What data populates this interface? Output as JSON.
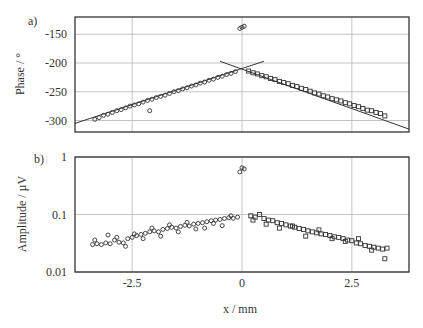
{
  "chart_data": [
    {
      "type": "scatter",
      "panel_label": "a)",
      "title": "",
      "xlabel": "x / mm",
      "ylabel": "Phase / °",
      "xlim": [
        -3.8,
        3.8
      ],
      "ylim": [
        -320,
        -120
      ],
      "yticks": [
        -150,
        -200,
        -250,
        -300
      ],
      "ytick_labels": [
        "-150",
        "-200",
        "-250",
        "-300"
      ],
      "xticks": [
        -2.5,
        0,
        2.5
      ],
      "grid": true,
      "fit_lines": [
        {
          "name": "left linear fit",
          "x": [
            -3.8,
            0.5
          ],
          "y": [
            -305,
            -197
          ]
        },
        {
          "name": "right linear fit",
          "x": [
            -0.5,
            3.8
          ],
          "y": [
            -197,
            -315
          ]
        }
      ],
      "series": [
        {
          "name": "left data (circles)",
          "marker": "circle",
          "x": [
            -3.35,
            -3.25,
            -3.15,
            -3.05,
            -2.95,
            -2.85,
            -2.75,
            -2.65,
            -2.55,
            -2.45,
            -2.35,
            -2.25,
            -2.15,
            -2.05,
            -1.95,
            -1.85,
            -1.75,
            -1.65,
            -1.55,
            -1.45,
            -1.35,
            -1.25,
            -1.15,
            -1.05,
            -0.95,
            -0.85,
            -0.75,
            -0.65,
            -0.55,
            -0.45,
            -0.35,
            -0.25,
            -0.15,
            -2.1
          ],
          "y": [
            -298,
            -295,
            -291,
            -289,
            -286,
            -283,
            -281,
            -278,
            -275,
            -273,
            -271,
            -268,
            -265,
            -263,
            -260,
            -258,
            -256,
            -253,
            -250,
            -248,
            -245,
            -243,
            -240,
            -238,
            -235,
            -233,
            -230,
            -228,
            -225,
            -223,
            -220,
            -218,
            -215,
            -283
          ]
        },
        {
          "name": "right data (squares)",
          "marker": "square",
          "x": [
            0.15,
            0.25,
            0.35,
            0.45,
            0.55,
            0.65,
            0.75,
            0.85,
            0.95,
            1.05,
            1.15,
            1.25,
            1.35,
            1.45,
            1.55,
            1.65,
            1.75,
            1.85,
            1.95,
            2.05,
            2.15,
            2.25,
            2.35,
            2.45,
            2.55,
            2.65,
            2.75,
            2.85,
            2.95,
            3.05,
            3.15,
            3.25
          ],
          "y": [
            -214,
            -217,
            -219,
            -222,
            -224,
            -227,
            -229,
            -232,
            -234,
            -236,
            -239,
            -241,
            -244,
            -246,
            -249,
            -252,
            -254,
            -257,
            -259,
            -262,
            -264,
            -266,
            -269,
            -271,
            -274,
            -276,
            -279,
            -282,
            -283,
            -286,
            -288,
            -292
          ]
        },
        {
          "name": "center spike",
          "marker": "circle",
          "x": [
            -0.05,
            0.0,
            0.05
          ],
          "y": [
            -140,
            -138,
            -136
          ]
        }
      ]
    },
    {
      "type": "scatter",
      "panel_label": "b)",
      "title": "",
      "xlabel": "x / mm",
      "ylabel": "Amplitude / µV",
      "yscale": "log",
      "xlim": [
        -3.8,
        3.8
      ],
      "ylim": [
        0.01,
        1
      ],
      "yticks": [
        1,
        0.1,
        0.01
      ],
      "ytick_labels": [
        "1",
        "0.1",
        "0.01"
      ],
      "xticks": [
        -2.5,
        0,
        2.5
      ],
      "xtick_labels": [
        "-2.5",
        "0",
        "2.5"
      ],
      "grid": true,
      "series": [
        {
          "name": "left data (circles)",
          "marker": "circle",
          "x": [
            -3.4,
            -3.3,
            -3.2,
            -3.1,
            -3.0,
            -2.9,
            -2.8,
            -2.7,
            -2.6,
            -2.5,
            -2.4,
            -2.3,
            -2.2,
            -2.1,
            -2.0,
            -1.9,
            -1.8,
            -1.7,
            -1.6,
            -1.5,
            -1.4,
            -1.3,
            -1.2,
            -1.1,
            -1.0,
            -0.9,
            -0.8,
            -0.7,
            -0.6,
            -0.5,
            -0.4,
            -0.3,
            -0.2,
            -0.1,
            -3.35,
            -3.05,
            -2.85,
            -2.65,
            -2.45,
            -2.25,
            -2.05,
            -1.85,
            -1.65,
            -1.45,
            -1.25,
            -1.05,
            -0.85,
            -0.65,
            -0.45,
            -0.25
          ],
          "y": [
            0.03,
            0.031,
            0.03,
            0.032,
            0.031,
            0.036,
            0.033,
            0.032,
            0.038,
            0.04,
            0.043,
            0.045,
            0.047,
            0.05,
            0.052,
            0.05,
            0.055,
            0.057,
            0.06,
            0.058,
            0.062,
            0.065,
            0.063,
            0.068,
            0.07,
            0.072,
            0.075,
            0.078,
            0.08,
            0.082,
            0.085,
            0.088,
            0.086,
            0.09,
            0.036,
            0.044,
            0.04,
            0.028,
            0.046,
            0.038,
            0.058,
            0.042,
            0.066,
            0.05,
            0.073,
            0.056,
            0.058,
            0.07,
            0.064,
            0.095
          ]
        },
        {
          "name": "right data (squares)",
          "marker": "square",
          "x": [
            0.2,
            0.3,
            0.4,
            0.5,
            0.6,
            0.7,
            0.8,
            0.9,
            1.0,
            1.1,
            1.2,
            1.3,
            1.4,
            1.5,
            1.6,
            1.7,
            1.8,
            1.9,
            2.0,
            2.1,
            2.2,
            2.3,
            2.4,
            2.5,
            2.6,
            2.7,
            2.8,
            2.9,
            3.0,
            3.1,
            3.2,
            3.3,
            0.25,
            0.55,
            0.85,
            1.15,
            1.45,
            1.75,
            2.05,
            2.35,
            2.65,
            2.95,
            3.25
          ],
          "y": [
            0.095,
            0.09,
            0.1,
            0.085,
            0.08,
            0.078,
            0.072,
            0.07,
            0.066,
            0.063,
            0.06,
            0.057,
            0.055,
            0.052,
            0.05,
            0.048,
            0.046,
            0.045,
            0.043,
            0.041,
            0.04,
            0.038,
            0.036,
            0.035,
            0.032,
            0.031,
            0.029,
            0.028,
            0.027,
            0.026,
            0.025,
            0.026,
            0.08,
            0.068,
            0.058,
            0.063,
            0.042,
            0.054,
            0.038,
            0.034,
            0.038,
            0.024,
            0.017
          ]
        },
        {
          "name": "center spike",
          "marker": "circle",
          "x": [
            -0.05,
            0.0,
            0.05
          ],
          "y": [
            0.55,
            0.65,
            0.62
          ]
        }
      ]
    }
  ],
  "figure": {
    "panel_a_label": "a)",
    "panel_b_label": "b)",
    "phase_ylabel": "Phase / °",
    "amp_ylabel": "Amplitude / µV",
    "xlabel": "x / mm",
    "xtick_labels": [
      "-2.5",
      "0",
      "2.5"
    ]
  }
}
